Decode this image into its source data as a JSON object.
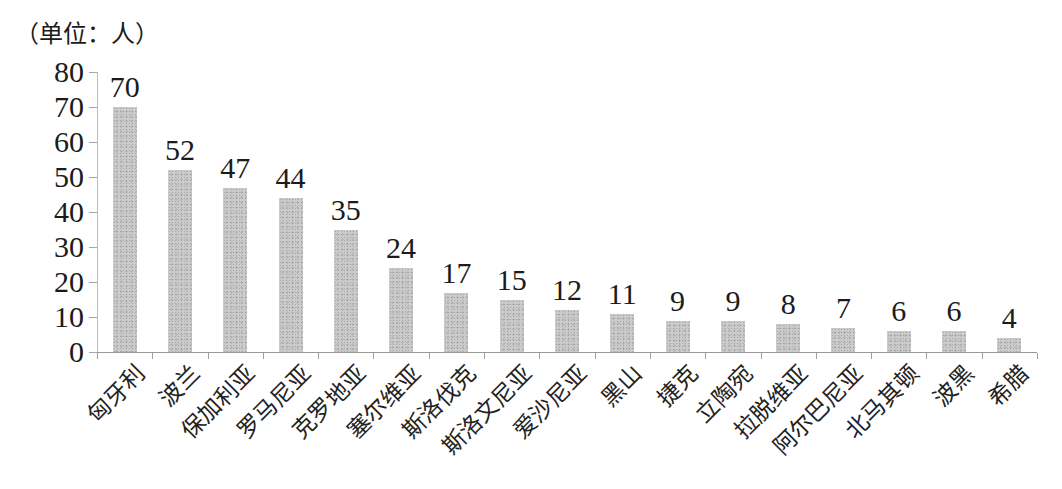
{
  "chart_data": {
    "type": "bar",
    "title": "",
    "unit_label": "（单位：人）",
    "categories": [
      "匈牙利",
      "波兰",
      "保加利亚",
      "罗马尼亚",
      "克罗地亚",
      "塞尔维亚",
      "斯洛伐克",
      "斯洛文尼亚",
      "爱沙尼亚",
      "黑山",
      "捷克",
      "立陶宛",
      "拉脱维亚",
      "阿尔巴尼亚",
      "北马其顿",
      "波黑",
      "希腊"
    ],
    "values": [
      70,
      52,
      47,
      44,
      35,
      24,
      17,
      15,
      12,
      11,
      9,
      9,
      8,
      7,
      6,
      6,
      4
    ],
    "value_labels_shown": true,
    "xlabel": "",
    "ylabel": "（单位：人）",
    "ylim": [
      0,
      80
    ],
    "y_ticks": [
      0,
      10,
      20,
      30,
      40,
      50,
      60,
      70,
      80
    ],
    "grid": false,
    "legend": false,
    "x_label_rotation_deg": 45,
    "colors": {
      "bar_fill": "#c9c9c9",
      "axis": "#9a9a9a",
      "text": "#1b1b1b",
      "background": "#ffffff"
    }
  }
}
